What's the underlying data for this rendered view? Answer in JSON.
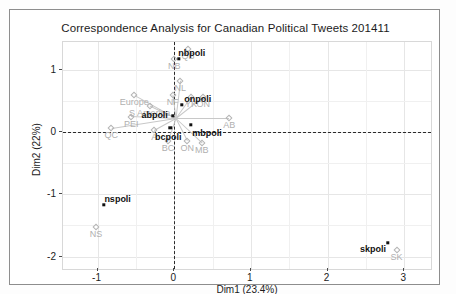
{
  "figure": {
    "title": "Correspondence Analysis for Canadian Political Tweets 201411",
    "xlabel": "Dim1 (23.4%)",
    "ylabel": "Dim2 (22%)",
    "colors": {
      "column_points": "#111111",
      "row_points": "#b0b0b0",
      "grid": "#e6e6e6",
      "zero_axis": "#2b2b2b",
      "panel_background": "#ffffff"
    }
  },
  "chart_data": {
    "type": "scatter",
    "title": "Correspondence Analysis for Canadian Political Tweets 201411",
    "xlabel": "Dim1 (23.4%)",
    "ylabel": "Dim2 (22%)",
    "xlim": [
      -1.45,
      3.35
    ],
    "ylim": [
      -2.2,
      1.45
    ],
    "xticks": [
      -1,
      0,
      1,
      2,
      3
    ],
    "yticks": [
      1,
      0,
      -1,
      -2
    ],
    "xtick_labels": [
      "-1",
      "0",
      "1",
      "2",
      "3"
    ],
    "ytick_labels": [
      "1",
      "0",
      "-1",
      "-2"
    ],
    "grid": true,
    "legend": "none",
    "zero_lines": {
      "vertical_x": 0,
      "horizontal_y": 0,
      "style": "dashed"
    },
    "series": [
      {
        "name": "hashtags",
        "marker": "filled-circle",
        "color": "#111111",
        "points": [
          {
            "label": "nbpoli",
            "x": 0.06,
            "y": 1.18
          },
          {
            "label": "onpoli",
            "x": 0.1,
            "y": 0.44
          },
          {
            "label": "abpoli",
            "x": -0.02,
            "y": 0.26
          },
          {
            "label": "bcpoli",
            "x": -0.05,
            "y": 0.07
          },
          {
            "label": "mbpoli",
            "x": 0.22,
            "y": 0.12
          },
          {
            "label": "nspoli",
            "x": -0.92,
            "y": -1.17
          },
          {
            "label": "skpoli",
            "x": 2.79,
            "y": -1.78
          }
        ]
      },
      {
        "name": "locations",
        "marker": "open-diamond",
        "color": "#b0b0b0",
        "points": [
          {
            "label": "QB",
            "x": 0.18,
            "y": 1.33
          },
          {
            "label": "NB",
            "x": 0.0,
            "y": 1.18
          },
          {
            "label": "NL",
            "x": 0.08,
            "y": 0.83
          },
          {
            "label": "NF",
            "x": -0.02,
            "y": 0.6
          },
          {
            "label": "YK",
            "x": 0.22,
            "y": 0.57
          },
          {
            "label": "ON",
            "x": 0.38,
            "y": 0.57
          },
          {
            "label": "Europe",
            "x": -0.52,
            "y": 0.59
          },
          {
            "label": "S America",
            "x": -0.32,
            "y": 0.42
          },
          {
            "label": "PEI",
            "x": -0.56,
            "y": 0.25
          },
          {
            "label": "AB",
            "x": 0.72,
            "y": 0.22
          },
          {
            "label": "QC",
            "x": -0.82,
            "y": 0.06
          },
          {
            "label": "A",
            "x": -0.26,
            "y": 0.03
          },
          {
            "label": "BC",
            "x": -0.08,
            "y": -0.14
          },
          {
            "label": "ON",
            "x": 0.17,
            "y": -0.14
          },
          {
            "label": "MB",
            "x": 0.36,
            "y": -0.17
          },
          {
            "label": "NS",
            "x": -1.02,
            "y": -1.52
          },
          {
            "label": "SK",
            "x": 2.9,
            "y": -1.9
          }
        ]
      }
    ]
  }
}
